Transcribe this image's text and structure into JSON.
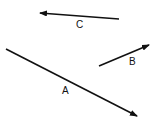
{
  "diagram": {
    "type": "vector-arrows",
    "stroke_color": "#111111",
    "background": "#ffffff",
    "vectors": [
      {
        "label": "A",
        "tail": [
          6,
          49
        ],
        "head": [
          137,
          116
        ],
        "label_pos": [
          62,
          86
        ]
      },
      {
        "label": "B",
        "tail": [
          99,
          66
        ],
        "head": [
          149,
          45
        ],
        "label_pos": [
          129,
          57
        ]
      },
      {
        "label": "C",
        "tail": [
          119,
          19
        ],
        "head": [
          40,
          13
        ],
        "label_pos": [
          76,
          20
        ]
      }
    ]
  }
}
